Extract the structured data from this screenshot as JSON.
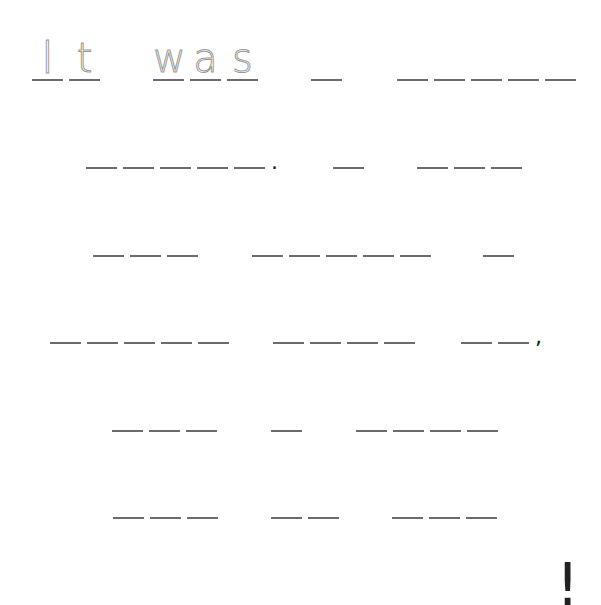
{
  "worksheet": {
    "prefilled_text": "It was",
    "colors": {
      "trace_letter": "#9a9a9a",
      "blank_line": "#6b6b6b",
      "punctuation": "#1a1a1a"
    },
    "rows": [
      {
        "words": [
          {
            "letters": [
              "I",
              "t"
            ],
            "x": 32
          },
          {
            "letters": [
              "w",
              "a",
              "s"
            ],
            "x": 153
          },
          {
            "blanks": 1,
            "x": 311
          },
          {
            "blanks": 5,
            "x": 397
          }
        ],
        "y": 81
      },
      {
        "words": [
          {
            "blanks": 5,
            "x": 86,
            "after": "."
          },
          {
            "blanks": 1,
            "x": 333
          },
          {
            "blanks": 3,
            "x": 417
          }
        ],
        "y": 169
      },
      {
        "words": [
          {
            "blanks": 3,
            "x": 93
          },
          {
            "blanks": 5,
            "x": 252
          },
          {
            "blanks": 1,
            "x": 483
          }
        ],
        "y": 257
      },
      {
        "words": [
          {
            "blanks": 5,
            "x": 50
          },
          {
            "blanks": 4,
            "x": 273
          },
          {
            "blanks": 2,
            "x": 461,
            "after": ","
          }
        ],
        "y": 344
      },
      {
        "words": [
          {
            "blanks": 3,
            "x": 112
          },
          {
            "blanks": 1,
            "x": 271
          },
          {
            "blanks": 4,
            "x": 356
          }
        ],
        "y": 432
      },
      {
        "words": [
          {
            "blanks": 3,
            "x": 113
          },
          {
            "blanks": 2,
            "x": 271
          },
          {
            "blanks": 3,
            "x": 392
          }
        ],
        "y": 519
      }
    ],
    "final_punctuation": {
      "char": "!",
      "x": 556,
      "y": 556
    }
  }
}
